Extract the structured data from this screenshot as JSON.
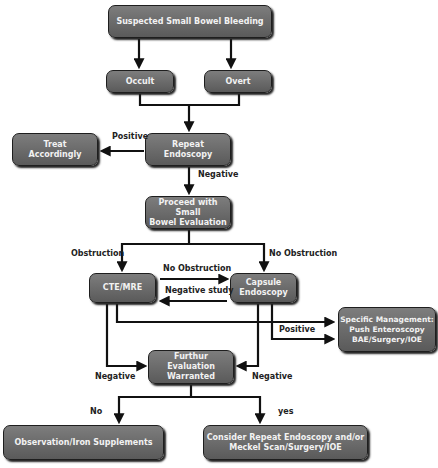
{
  "nodes": {
    "suspected": "Suspected Small Bowel Bleeding",
    "occult": "Occult",
    "overt": "Overt",
    "treat": "Treat\nAccordingly",
    "repeat": "Repeat\nEndoscopy",
    "proceed": "Proceed with Small\nBowel Evaluation",
    "cte": "CTE/MRE",
    "capsule": "Capsule\nEndoscopy",
    "specific": "Specific Management:\nPush Enteroscopy\nBAE/Surgery/IOE",
    "further": "Furthur Evaluation\nWarranted",
    "observation": "Observation/Iron Supplements",
    "consider": "Consider Repeat Endoscopy and/or\nMeckel Scan/Surgery/IOE"
  },
  "edge_labels": {
    "positive_treat": "Positive",
    "negative_repeat": "Negative",
    "obstruction": "Obstruction",
    "no_obstruction_right": "No Obstruction",
    "no_obstruction_mid": "No Obstruction",
    "negative_study": "Negative study",
    "positive_specific": "Positive",
    "negative_left": "Negative",
    "negative_right": "Negative",
    "no": "No",
    "yes": "yes"
  }
}
